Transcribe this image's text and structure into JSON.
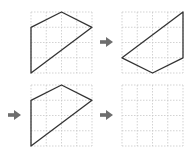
{
  "grid": {
    "rows": 4,
    "cols": 4,
    "cell_px": 15.25,
    "line_color": "#c8c8c8",
    "shape_color": "#333333",
    "arrow_color": "#6e6e6e"
  },
  "panels": [
    {
      "id": "panel-1",
      "label": "Step 1",
      "origin": [
        31,
        12
      ],
      "polygon": [
        [
          0,
          1
        ],
        [
          2,
          0
        ],
        [
          4,
          1
        ],
        [
          0,
          4
        ]
      ]
    },
    {
      "id": "panel-2",
      "label": "Step 2",
      "origin": [
        122,
        12
      ],
      "polygon": [
        [
          4,
          0
        ],
        [
          4,
          3
        ],
        [
          2,
          4
        ],
        [
          0,
          3
        ]
      ]
    },
    {
      "id": "panel-3",
      "label": "Step 3",
      "origin": [
        31,
        85
      ],
      "polygon": [
        [
          0,
          1
        ],
        [
          2,
          0
        ],
        [
          4,
          1
        ],
        [
          0,
          4
        ]
      ]
    },
    {
      "id": "panel-4",
      "label": "Answer (blank)",
      "origin": [
        122,
        85
      ],
      "polygon": []
    }
  ],
  "arrows": [
    {
      "id": "arrow-1-2",
      "x": 100,
      "y": 42
    },
    {
      "id": "arrow-2-3",
      "x": 8,
      "y": 115
    },
    {
      "id": "arrow-3-4",
      "x": 100,
      "y": 115
    }
  ]
}
